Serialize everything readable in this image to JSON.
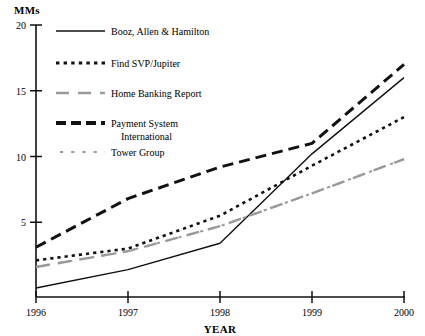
{
  "chart_data": {
    "type": "line",
    "title": "",
    "ylabel": "MMs",
    "xlabel": "YEAR",
    "categories": [
      "1996",
      "1997",
      "1998",
      "1999",
      "2000"
    ],
    "x": [
      1996,
      1997,
      1998,
      1999,
      2000
    ],
    "xlim": [
      1996,
      2000
    ],
    "ylim": [
      0,
      20
    ],
    "yticks": [
      5,
      10,
      15,
      20
    ],
    "ytick_labels": [
      "5",
      "10",
      "15",
      "20"
    ],
    "grid": false,
    "legend_position": "upper-left-inside",
    "series": [
      {
        "name": "Booz, Allen & Hamilton",
        "style": "solid",
        "color": "#111111",
        "width": 1.4,
        "values": [
          0.0,
          1.4,
          3.4,
          10.2,
          16.0
        ]
      },
      {
        "name": "Find SVP/Jupiter",
        "style": "dotted",
        "color": "#111111",
        "width": 2.6,
        "values": [
          2.1,
          3.0,
          5.5,
          9.3,
          13.0
        ]
      },
      {
        "name": "Home Banking Report",
        "style": "dashed-gray",
        "color": "#9a9a9a",
        "width": 2.4,
        "values": [
          1.6,
          2.8,
          4.7,
          7.2,
          9.8
        ]
      },
      {
        "name": "Payment System International",
        "style": "thick-dashed",
        "color": "#111111",
        "width": 3.0,
        "values": [
          3.1,
          6.8,
          9.2,
          11.0,
          17.0
        ]
      },
      {
        "name": "Tower Group",
        "style": "dotted-gray",
        "color": "#9a9a9a",
        "width": 2.0,
        "values": [
          1.6,
          2.8,
          4.7,
          7.2,
          9.8
        ]
      }
    ],
    "legend_entries": [
      {
        "label": "Booz, Allen & Hamilton",
        "style": "solid",
        "color": "#111111"
      },
      {
        "label": "Find SVP/Jupiter",
        "style": "dotted",
        "color": "#111111"
      },
      {
        "label": "Home Banking Report",
        "style": "dashed-gray",
        "color": "#9a9a9a"
      },
      {
        "label": "Payment System",
        "label2": "International",
        "style": "thick-dashed",
        "color": "#111111"
      },
      {
        "label": "Tower Group",
        "style": "dotted-gray",
        "color": "#9a9a9a"
      }
    ]
  },
  "axes": {
    "y_axis_label": "MMs",
    "x_axis_label": "YEAR",
    "y_tick_20": "20",
    "y_tick_15": "15",
    "y_tick_10": "10",
    "y_tick_5": "5",
    "x_tick_1996": "1996",
    "x_tick_1997": "1997",
    "x_tick_1998": "1998",
    "x_tick_1999": "1999",
    "x_tick_2000": "2000"
  },
  "legend": {
    "item1": "Booz, Allen & Hamilton",
    "item2": "Find SVP/Jupiter",
    "item3": "Home Banking Report",
    "item4_line1": "Payment System",
    "item4_line2": "International",
    "item5": "Tower Group"
  },
  "colors": {
    "ink": "#111111",
    "gray": "#9a9a9a",
    "background": "#ffffff"
  }
}
